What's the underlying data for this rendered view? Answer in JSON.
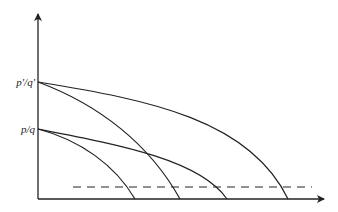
{
  "diagram": {
    "type": "economic-curves",
    "y_axis_labels": [
      {
        "id": "upper",
        "text": "p'/q'"
      },
      {
        "id": "lower",
        "text": "p/q"
      }
    ],
    "curves": [
      {
        "id": "upper-flat",
        "origin": "p'/q'",
        "style": "solid"
      },
      {
        "id": "upper-steep",
        "origin": "p'/q'",
        "style": "solid"
      },
      {
        "id": "lower-flat",
        "origin": "p/q",
        "style": "solid"
      },
      {
        "id": "lower-steep",
        "origin": "p/q",
        "style": "solid"
      }
    ],
    "threshold_line": {
      "style": "dashed"
    },
    "colors": {
      "line": "#222222",
      "background": "#ffffff"
    }
  }
}
